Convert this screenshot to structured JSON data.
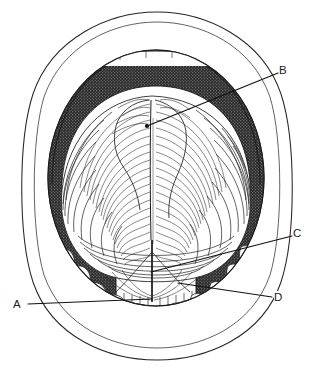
{
  "figure": {
    "kind": "anatomical-line-drawing",
    "background_color": "#ffffff",
    "ink_color": "#1c1c1c",
    "width": 315,
    "height": 375
  },
  "labels": [
    {
      "id": "A",
      "text": "A",
      "x": 18,
      "y": 305,
      "leader": {
        "x1": 28,
        "y1": 304,
        "x2": 152,
        "y2": 299
      }
    },
    {
      "id": "B",
      "text": "B",
      "x": 283,
      "y": 71,
      "leader": {
        "x1": 278,
        "y1": 73,
        "x2": 147,
        "y2": 126
      }
    },
    {
      "id": "C",
      "text": "C",
      "x": 297,
      "y": 234,
      "leader": {
        "x1": 292,
        "y1": 236,
        "x2": 151,
        "y2": 272
      }
    },
    {
      "id": "D",
      "text": "D",
      "x": 278,
      "y": 298,
      "leader": {
        "x1": 272,
        "y1": 297,
        "x2": 178,
        "y2": 283
      }
    }
  ],
  "regions": [
    {
      "name": "outer-lip-outline",
      "shading": "none"
    },
    {
      "name": "inner-lip-outline",
      "shading": "none"
    },
    {
      "name": "palate-vault",
      "shading": "dense-stipple-dark"
    },
    {
      "name": "tongue-dorsum",
      "shading": "fine-hatching-light"
    },
    {
      "name": "median-sulcus",
      "shading": "line"
    },
    {
      "name": "lingual-frenulum",
      "shading": "line"
    },
    {
      "name": "lower-teeth-arch",
      "shading": "outline-white"
    },
    {
      "name": "floor-of-mouth",
      "shading": "short-hatching"
    }
  ]
}
